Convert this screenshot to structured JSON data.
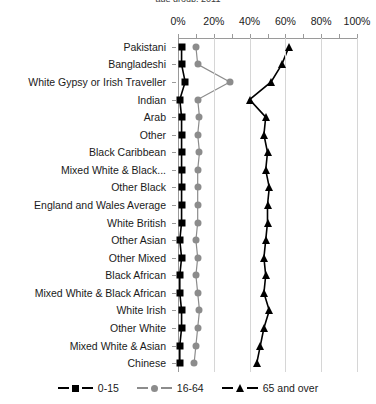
{
  "title_clipped": "age group, 2011",
  "axis": {
    "x_ticks": [
      "0%",
      "20%",
      "40%",
      "60%",
      "80%",
      "100%"
    ],
    "x_min": 0,
    "x_max": 100
  },
  "legend": {
    "items": [
      {
        "label": "0-15",
        "color": "#000000",
        "marker": "square"
      },
      {
        "label": "16-64",
        "color": "#8c8c8c",
        "marker": "circle"
      },
      {
        "label": "65 and over",
        "color": "#000000",
        "marker": "triangle"
      }
    ]
  },
  "chart_data": {
    "type": "line",
    "title": "age group, 2011",
    "xlabel": "",
    "ylabel": "",
    "xlim": [
      0,
      100
    ],
    "grid": true,
    "legend_position": "bottom",
    "orientation": "horizontal",
    "categories": [
      "Pakistani",
      "Bangladeshi",
      "White Gypsy or Irish Traveller",
      "Indian",
      "Arab",
      "Other",
      "Black Caribbean",
      "Mixed White & Black...",
      "Other Black",
      "England and Wales Average",
      "White British",
      "Other Asian",
      "Other Mixed",
      "Black African",
      "Mixed White & Black African",
      "White Irish",
      "Other White",
      "Mixed White & Asian",
      "Chinese"
    ],
    "series": [
      {
        "name": "0-15",
        "color": "#000000",
        "marker": "square",
        "values": [
          2,
          2,
          4,
          1,
          2,
          2,
          2,
          2,
          2,
          2,
          2,
          1,
          2,
          1,
          1,
          2,
          2,
          1,
          1
        ]
      },
      {
        "name": "16-64",
        "color": "#8c8c8c",
        "marker": "circle",
        "values": [
          10,
          11,
          29,
          11,
          12,
          11,
          12,
          11,
          11,
          11,
          11,
          10,
          11,
          10,
          11,
          12,
          11,
          10,
          9
        ]
      },
      {
        "name": "65 and over",
        "color": "#000000",
        "marker": "triangle",
        "values": [
          62,
          58,
          52,
          40,
          49,
          48,
          50,
          49,
          51,
          50,
          50,
          49,
          48,
          49,
          48,
          51,
          48,
          46,
          44
        ]
      }
    ]
  }
}
